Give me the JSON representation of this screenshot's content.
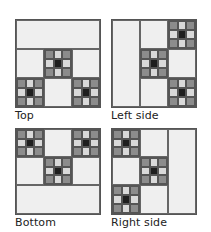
{
  "figure": {
    "panels": [
      {
        "id": "top",
        "label": "Top"
      },
      {
        "id": "left-side",
        "label": "Left side"
      },
      {
        "id": "bottom",
        "label": "Bottom"
      },
      {
        "id": "right-side",
        "label": "Right side"
      }
    ],
    "colors": {
      "plain_block": "#efefef",
      "outline": "#555555",
      "nine_patch_corner": "#8c8c8c",
      "nine_patch_edge": "#d9d9d9",
      "nine_patch_center": "#1e1e1e"
    }
  }
}
